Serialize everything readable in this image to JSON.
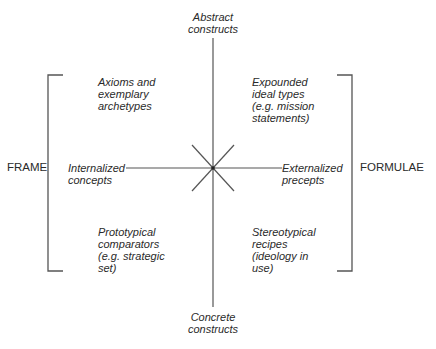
{
  "diagram": {
    "axes": {
      "top": "Abstract\nconstructs",
      "bottom": "Concrete\nconstructs",
      "left": "Internalized\nconcepts",
      "right": "Externalized\nprecepts"
    },
    "quadrants": {
      "top_left": "Axioms and\nexemplary\narchetypes",
      "top_right": "Expounded\nideal types\n(e.g. mission\nstatements)",
      "bottom_left": "Prototypical\ncomparators\n(e.g. strategic\nset)",
      "bottom_right": "Stereotypical\nrecipes\n(ideology in\nuse)"
    },
    "brackets": {
      "left": "FRAME",
      "right": "FORMULAE"
    },
    "colors": {
      "line": "#555555",
      "text": "#2a2a2a",
      "background": "#ffffff"
    }
  }
}
